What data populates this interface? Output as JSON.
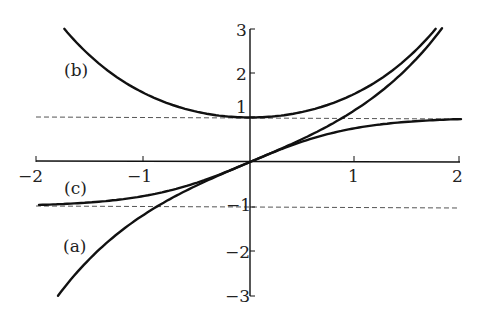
{
  "chart_data": {
    "type": "line",
    "title": "",
    "xlabel": "",
    "ylabel": "",
    "xlim": [
      -2,
      2
    ],
    "ylim": [
      -3,
      3
    ],
    "grid": false,
    "legend": "none (inline curve labels)",
    "x_ticks": [
      -2,
      -1,
      1,
      2
    ],
    "y_ticks": [
      3,
      2,
      1,
      -1,
      -2,
      -3
    ],
    "x_tick_labels": [
      "−2",
      "−1",
      "1",
      "2"
    ],
    "y_tick_labels": [
      "3",
      "2",
      "1",
      "−1",
      "−2",
      "−3"
    ],
    "series": [
      {
        "name": "(a)",
        "function": "sinh(x)",
        "x": [
          -1.82,
          -1.5,
          -1,
          -0.5,
          0,
          0.5,
          1,
          1.5,
          1.82
        ],
        "values": [
          -3.0,
          -2.13,
          -1.18,
          -0.52,
          0,
          0.52,
          1.18,
          2.13,
          3.0
        ]
      },
      {
        "name": "(b)",
        "function": "cosh(x)",
        "x": [
          -1.76,
          -1.5,
          -1,
          -0.5,
          0,
          0.5,
          1,
          1.5,
          1.76
        ],
        "values": [
          3.0,
          2.35,
          1.54,
          1.13,
          1.0,
          1.13,
          1.54,
          2.35,
          3.0
        ]
      },
      {
        "name": "(c)",
        "function": "tanh(x)",
        "x": [
          -2,
          -1.5,
          -1,
          -0.5,
          0,
          0.5,
          1,
          1.5,
          2
        ],
        "values": [
          -0.96,
          -0.91,
          -0.76,
          -0.46,
          0,
          0.46,
          0.76,
          0.91,
          0.96
        ]
      }
    ],
    "annotations": [
      {
        "text": "(a)",
        "near": "sinh curve, lower left"
      },
      {
        "text": "(b)",
        "near": "cosh curve, upper left"
      },
      {
        "text": "(c)",
        "near": "tanh curve, left"
      }
    ],
    "asymptotes": [
      {
        "y": 1,
        "style": "dashed"
      },
      {
        "y": -1,
        "style": "dashed"
      }
    ]
  },
  "labels": {
    "a": "(a)",
    "b": "(b)",
    "c": "(c)",
    "x_neg2": "−2",
    "x_neg1": "−1",
    "x_1": "1",
    "x_2": "2",
    "y_3": "3",
    "y_2": "2",
    "y_1": "1",
    "y_neg1": "−1",
    "y_neg2": "−2",
    "y_neg3": "−3"
  }
}
